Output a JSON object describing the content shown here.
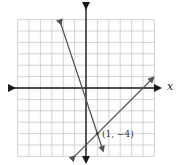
{
  "chart_data": {
    "type": "line",
    "title": "",
    "xlabel": "x",
    "ylabel": "",
    "xlim": [
      -6,
      6
    ],
    "ylim": [
      -6,
      6
    ],
    "grid": true,
    "series": [
      {
        "name": "line-1",
        "equation": "y = -3x - 1",
        "x": [
          -2.2,
          1.5
        ],
        "y": [
          5.6,
          -5.5
        ]
      },
      {
        "name": "line-2",
        "equation": "y = x - 5",
        "x": [
          -1,
          5.9
        ],
        "y": [
          -6,
          0.9
        ]
      }
    ],
    "annotations": [
      {
        "text": "(1, −4)",
        "x": 1,
        "y": -4
      }
    ]
  },
  "labels": {
    "x_axis": "x",
    "intersection": "(1, −4)"
  }
}
